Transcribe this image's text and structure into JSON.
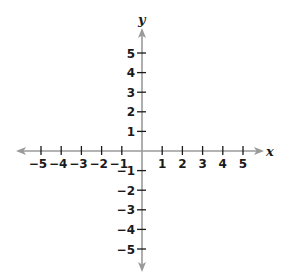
{
  "chart_data": {
    "type": "scatter",
    "title": "",
    "xlabel": "x",
    "ylabel": "y",
    "xlim": [
      -5,
      5
    ],
    "ylim": [
      -5,
      5
    ],
    "x_ticks": [
      -5,
      -4,
      -3,
      -2,
      -1,
      1,
      2,
      3,
      4,
      5
    ],
    "y_ticks": [
      5,
      4,
      3,
      2,
      1,
      -1,
      -2,
      -3,
      -4,
      -5
    ],
    "x_tick_labels": [
      "−5",
      "−4",
      "−3",
      "−2",
      "−1",
      "1",
      "2",
      "3",
      "4",
      "5"
    ],
    "y_tick_labels": [
      "5",
      "4",
      "3",
      "2",
      "1",
      "−1",
      "−2",
      "−3",
      "−4",
      "−5"
    ],
    "grid": false,
    "legend": null,
    "series": [],
    "axis_color": "#9a9a9a",
    "tick_color": "#1a1a1a"
  }
}
